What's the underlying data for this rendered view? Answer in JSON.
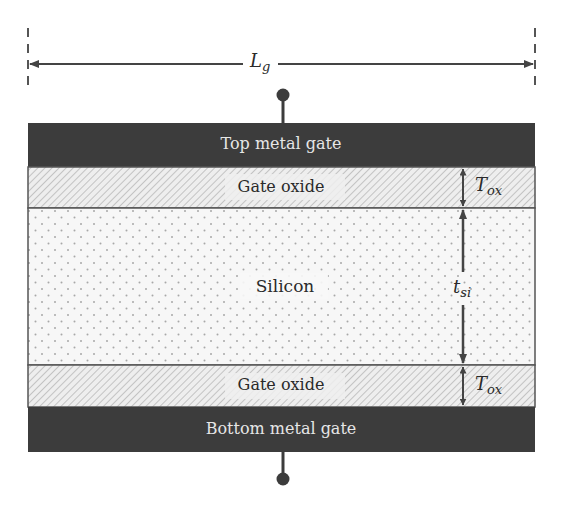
{
  "diagram": {
    "dimensions": {
      "gate_length": {
        "symbol": "L",
        "subscript": "g"
      },
      "oxide_thickness": {
        "symbol": "T",
        "subscript": "ox"
      },
      "silicon_thickness": {
        "symbol": "t",
        "subscript": "si"
      }
    },
    "layers": [
      {
        "name": "top-metal-gate",
        "label": "Top metal gate"
      },
      {
        "name": "top-gate-oxide",
        "label": "Gate oxide"
      },
      {
        "name": "silicon",
        "label": "Silicon"
      },
      {
        "name": "bottom-gate-oxide",
        "label": "Gate oxide"
      },
      {
        "name": "bottom-metal-gate",
        "label": "Bottom metal gate"
      }
    ],
    "colors": {
      "metal_gate": "#3c3c3c",
      "oxide_bg": "#eeeeee",
      "oxide_hatch": "#b8b8b8",
      "silicon_bg": "#f7f7f7",
      "silicon_dot": "#a8a8a8",
      "line": "#444444"
    }
  }
}
